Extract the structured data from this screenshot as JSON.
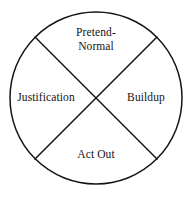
{
  "diagram": {
    "type": "cycle-quadrant-circle",
    "title": "",
    "stroke_color": "#141414",
    "background_color": "#ffffff",
    "stroke_width": 1.5,
    "circle": {
      "center_x": 96,
      "center_y": 98,
      "radius": 86
    },
    "dividers": [
      {
        "name": "diagonal-nw-se",
        "x1": 35,
        "y1": 37,
        "x2": 157,
        "y2": 159
      },
      {
        "name": "diagonal-ne-sw",
        "x1": 157,
        "y1": 37,
        "x2": 35,
        "y2": 159
      }
    ],
    "quadrants": [
      {
        "position": "top",
        "label": "Pretend-\nNormal"
      },
      {
        "position": "left",
        "label": "Justification"
      },
      {
        "position": "right",
        "label": "Buildup"
      },
      {
        "position": "bottom",
        "label": "Act Out"
      }
    ]
  }
}
